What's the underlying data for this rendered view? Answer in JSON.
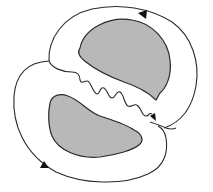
{
  "diagram": {
    "colors": {
      "background": "#ffffff",
      "stroke": "#2a2a2a",
      "lobe_fill": "#b8b8b8"
    },
    "elements": [
      {
        "id": "upper-lobe",
        "kind": "shaded-region"
      },
      {
        "id": "lower-lobe",
        "kind": "shaded-region"
      },
      {
        "id": "upper-flow-loop",
        "kind": "flow-line",
        "arrow_direction": "counterclockwise-top"
      },
      {
        "id": "lower-flow-loop",
        "kind": "flow-line",
        "arrow_direction": "counterclockwise-bottom"
      },
      {
        "id": "wavy-interface",
        "kind": "wavy-line",
        "arrow_at_end": true
      }
    ],
    "arrows": [
      {
        "location": "top-right",
        "direction": "left"
      },
      {
        "location": "bottom-left",
        "direction": "up-left"
      },
      {
        "location": "center-right",
        "direction": "down-right"
      }
    ]
  }
}
